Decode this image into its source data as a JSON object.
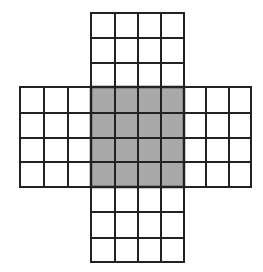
{
  "diagram": {
    "title": "",
    "colors": {
      "line": "#222222",
      "shaded": "#a9a9a9",
      "white": "#ffffff",
      "background": "#ffffff"
    },
    "cols_x": [
      20,
      44,
      68,
      91,
      115,
      138,
      161,
      184,
      206,
      229,
      251
    ],
    "rows_y": [
      13,
      38,
      63,
      87,
      113,
      138,
      162,
      187,
      212,
      238,
      262
    ],
    "regions": [
      {
        "name": "top-arm",
        "col_start": 3,
        "col_end": 7,
        "row_start": 0,
        "row_end": 3,
        "shaded": false
      },
      {
        "name": "left-arm",
        "col_start": 0,
        "col_end": 3,
        "row_start": 3,
        "row_end": 7,
        "shaded": false
      },
      {
        "name": "center-square",
        "col_start": 3,
        "col_end": 7,
        "row_start": 3,
        "row_end": 7,
        "shaded": true
      },
      {
        "name": "right-arm",
        "col_start": 7,
        "col_end": 10,
        "row_start": 3,
        "row_end": 7,
        "shaded": false
      },
      {
        "name": "bottom-arm",
        "col_start": 3,
        "col_end": 7,
        "row_start": 7,
        "row_end": 10,
        "shaded": false
      }
    ]
  }
}
